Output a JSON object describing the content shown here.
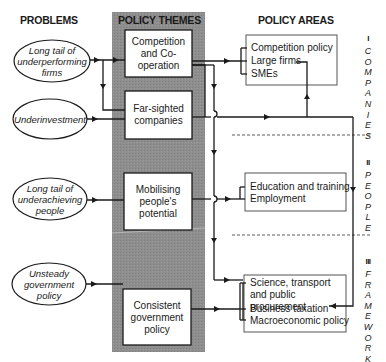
{
  "headers": {
    "problems": "PROBLEMS",
    "policy_themes": "POLICY THEMES",
    "policy_areas": "POLICY AREAS"
  },
  "problems": [
    {
      "label": "Long tail of underperforming firms"
    },
    {
      "label": "Underinvestment"
    },
    {
      "label": "Long tail of underachieving people"
    },
    {
      "label": "Unsteady government policy"
    }
  ],
  "themes": [
    {
      "label": "Competition and Co-operation"
    },
    {
      "label": "Far-sighted companies"
    },
    {
      "label": "Mobilising people's potential"
    },
    {
      "label": "Consistent government policy"
    }
  ],
  "areas": {
    "companies": {
      "roman": "I",
      "title": "COMPANIES",
      "items": [
        "Competition policy",
        "Large firms",
        "SMEs"
      ]
    },
    "people": {
      "roman": "II",
      "title": "PEOPLE",
      "items": [
        "Education and training",
        "Employment"
      ]
    },
    "framework": {
      "roman": "III",
      "title": "FRAMEWORK",
      "items": [
        "Science, transport and public procurement",
        "Business taxation",
        "Macroeconomic policy"
      ]
    }
  },
  "colors": {
    "band": "#8c8c8c",
    "line": "#1a1a1a",
    "box_border": "#555555"
  }
}
